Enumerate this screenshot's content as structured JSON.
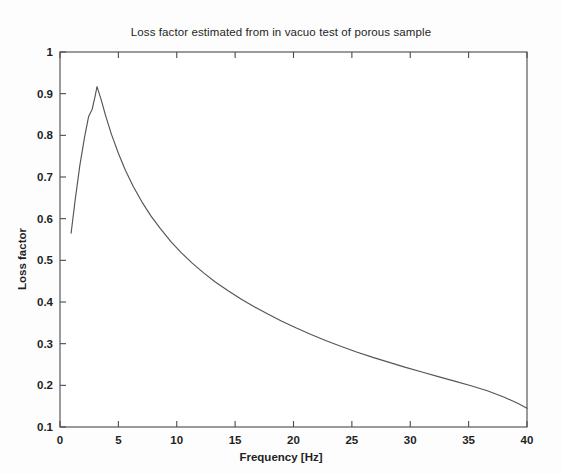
{
  "chart_data": {
    "type": "line",
    "title": "Loss factor estimated from in vacuo test of porous sample",
    "xlabel": "Frequency [Hz]",
    "ylabel": "Loss factor",
    "xlim": [
      0,
      40
    ],
    "ylim": [
      0.1,
      1
    ],
    "xticks": [
      0,
      5,
      10,
      15,
      20,
      25,
      30,
      35,
      40
    ],
    "xtick_labels": [
      "0",
      "5",
      "10",
      "15",
      "20",
      "25",
      "30",
      "35",
      "40"
    ],
    "yticks": [
      0.1,
      0.2,
      0.3,
      0.4,
      0.5,
      0.6,
      0.7,
      0.8,
      0.9,
      1
    ],
    "ytick_labels": [
      "0.1",
      "0.2",
      "0.3",
      "0.4",
      "0.5",
      "0.6",
      "0.7",
      "0.8",
      "0.9",
      "1"
    ],
    "grid": false,
    "legend": null,
    "line_color": "#555555",
    "series": [
      {
        "name": "Loss factor",
        "x": [
          0.95,
          1.3,
          1.7,
          2.1,
          2.45,
          2.75,
          3.0,
          3.17,
          3.5,
          3.9,
          4.4,
          5.0,
          5.6,
          6.3,
          7.0,
          7.8,
          8.6,
          9.5,
          10.4,
          11.3,
          12.3,
          13.3,
          14.4,
          15.5,
          16.6,
          17.8,
          19.0,
          20.2,
          21.5,
          22.8,
          24.1,
          25.4,
          26.8,
          28.2,
          29.6,
          31.0,
          32.4,
          33.8,
          35.2,
          36.6,
          38.0,
          39.2,
          40.0
        ],
        "y": [
          0.565,
          0.645,
          0.728,
          0.795,
          0.845,
          0.862,
          0.893,
          0.917,
          0.888,
          0.848,
          0.803,
          0.757,
          0.716,
          0.676,
          0.641,
          0.606,
          0.576,
          0.545,
          0.518,
          0.494,
          0.47,
          0.448,
          0.427,
          0.407,
          0.389,
          0.371,
          0.354,
          0.338,
          0.322,
          0.307,
          0.293,
          0.28,
          0.267,
          0.255,
          0.243,
          0.232,
          0.221,
          0.21,
          0.199,
          0.187,
          0.172,
          0.157,
          0.145
        ]
      }
    ],
    "annotations": {
      "peak_x": 3.17,
      "peak_y": 0.917,
      "start_x": 0.95,
      "start_y": 0.565,
      "end_x": 40,
      "end_y": 0.145
    }
  }
}
